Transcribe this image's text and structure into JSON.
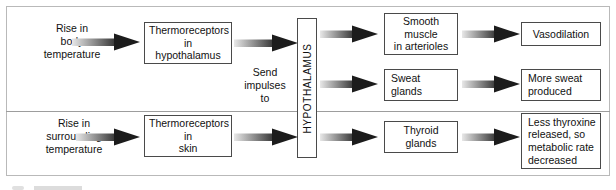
{
  "diagram": {
    "frame": {
      "border_color": "#b9b9b9"
    },
    "divider": {
      "color": "#9d9d9d"
    },
    "arrow": {
      "shaft_light": "#e2e2e2",
      "shaft_dark": "#2b2b2b",
      "head_color": "#1c1c1c"
    },
    "box_border_color": "#4a4a4a",
    "text_color": "#111111"
  },
  "hypothalamus": {
    "label": "HYPOTHALAMUS"
  },
  "stimuli": {
    "body": {
      "line1": "Rise in",
      "line2": "body",
      "line3": "temperature"
    },
    "surrounding": {
      "line1": "Rise in",
      "line2": "surrounding",
      "line3": "temperature"
    }
  },
  "receptors": {
    "hypothalamus": {
      "line1": "Thermoreceptors",
      "line2": "in",
      "line3": "hypothalamus"
    },
    "skin": {
      "line1": "Thermoreceptors",
      "line2": "in",
      "line3": "skin"
    }
  },
  "connector_note": {
    "line1": "Send",
    "line2": "impulses",
    "line3": "to"
  },
  "effectors": {
    "smooth_muscle": {
      "line1": "Smooth",
      "line2": "muscle",
      "line3": "in arterioles"
    },
    "sweat_glands": {
      "line1": "Sweat",
      "line2": "glands"
    },
    "thyroid_glands": {
      "line1": "Thyroid",
      "line2": "glands"
    }
  },
  "outcomes": {
    "vasodilation": {
      "line1": "Vasodilation"
    },
    "more_sweat": {
      "line1": "More sweat",
      "line2": "produced"
    },
    "less_thyroxine": {
      "line1": "Less thyroxine",
      "line2": "released, so",
      "line3": "metabolic rate",
      "line4": "decreased"
    }
  }
}
